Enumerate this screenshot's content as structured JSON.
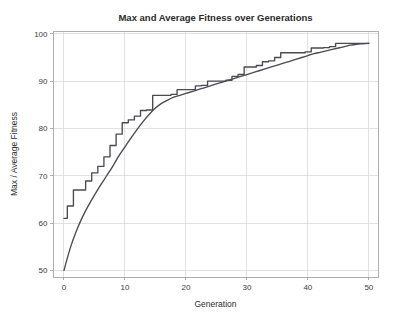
{
  "chart_data": {
    "type": "line",
    "title": "Max and Average Fitness over Generations",
    "xlabel": "Generation",
    "ylabel": "Max / Average Fitness",
    "xlim": [
      -1.8,
      51.5
    ],
    "ylim": [
      48.6,
      100.6
    ],
    "xticks": [
      0,
      10,
      20,
      30,
      40,
      50
    ],
    "yticks": [
      50,
      60,
      70,
      80,
      90,
      100
    ],
    "xtick_labels": [
      "0",
      "10",
      "20",
      "30",
      "40",
      "50"
    ],
    "ytick_labels": [
      "50",
      "60",
      "70",
      "80",
      "90",
      "100"
    ],
    "grid": true,
    "legend": "none",
    "background_color": "#ffffff",
    "grid_color": "#d4d4d8",
    "axis_color": "#9a9a9f",
    "x": [
      0,
      1,
      2,
      3,
      4,
      5,
      6,
      7,
      8,
      9,
      10,
      11,
      12,
      13,
      14,
      15,
      16,
      17,
      18,
      19,
      20,
      21,
      22,
      23,
      24,
      25,
      26,
      27,
      28,
      29,
      30,
      31,
      32,
      33,
      34,
      35,
      36,
      37,
      38,
      39,
      40,
      41,
      42,
      43,
      44,
      45,
      46,
      47,
      48,
      49,
      50
    ],
    "series": [
      {
        "name": "Max Fitness",
        "color": "#4a4a52",
        "style": "staircase",
        "values": [
          61.0,
          63.6,
          67.0,
          67.0,
          68.9,
          70.6,
          72.0,
          74.0,
          76.4,
          78.8,
          81.2,
          81.8,
          82.6,
          83.8,
          83.9,
          87.0,
          87.0,
          87.0,
          87.2,
          88.2,
          88.2,
          88.2,
          89.0,
          89.1,
          90.0,
          90.0,
          90.0,
          90.2,
          91.0,
          91.4,
          93.0,
          93.0,
          93.3,
          94.1,
          94.3,
          95.0,
          96.0,
          96.0,
          96.0,
          96.0,
          96.2,
          97.0,
          97.0,
          97.1,
          97.3,
          98.0,
          98.0,
          98.0,
          98.0,
          98.0,
          98.0
        ]
      },
      {
        "name": "Average Fitness",
        "color": "#4a4a52",
        "style": "smooth",
        "values": [
          50.0,
          54.6,
          58.2,
          61.2,
          63.7,
          65.9,
          68.0,
          70.0,
          72.0,
          74.2,
          76.1,
          78.0,
          79.8,
          81.5,
          83.0,
          84.3,
          85.3,
          86.0,
          86.6,
          87.0,
          87.4,
          87.8,
          88.2,
          88.6,
          89.0,
          89.4,
          89.8,
          90.2,
          90.6,
          91.0,
          91.4,
          91.8,
          92.2,
          92.6,
          93.0,
          93.4,
          93.8,
          94.2,
          94.6,
          95.0,
          95.4,
          95.8,
          96.1,
          96.4,
          96.7,
          97.0,
          97.3,
          97.6,
          97.8,
          97.9,
          98.0
        ]
      }
    ]
  }
}
